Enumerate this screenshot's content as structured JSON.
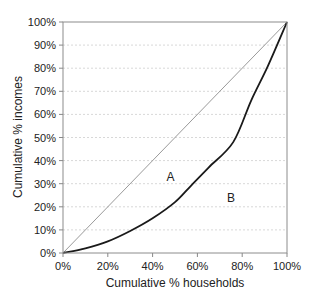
{
  "chart_data": {
    "type": "line",
    "title": "",
    "xlabel": "Cumulative % households",
    "ylabel": "Cumulative % incomes",
    "xlim": [
      0,
      100
    ],
    "ylim": [
      0,
      100
    ],
    "x_ticks": [
      "0%",
      "20%",
      "40%",
      "60%",
      "80%",
      "100%"
    ],
    "y_ticks": [
      "0%",
      "10%",
      "20%",
      "30%",
      "40%",
      "50%",
      "60%",
      "70%",
      "80%",
      "90%",
      "100%"
    ],
    "grid": "horizontal dotted",
    "legend": "none",
    "series": [
      {
        "name": "Line of equality",
        "style": "thin gray",
        "x": [
          0,
          100
        ],
        "y": [
          0,
          100
        ]
      },
      {
        "name": "Lorenz curve",
        "style": "thick black",
        "x": [
          0,
          10,
          20,
          30,
          40,
          50,
          57,
          65,
          76,
          84,
          91.5,
          100
        ],
        "y": [
          0,
          2,
          5,
          9.5,
          15,
          22,
          29,
          37,
          48,
          66,
          81,
          100
        ]
      }
    ],
    "annotations": [
      {
        "text": "A",
        "x": 48,
        "y": 33
      },
      {
        "text": "B",
        "x": 75,
        "y": 24
      }
    ]
  }
}
